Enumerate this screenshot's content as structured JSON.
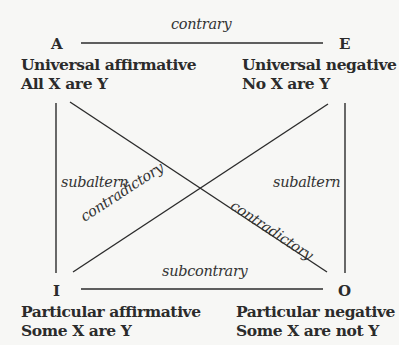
{
  "corners": {
    "A": {
      "letter": "A",
      "name": "Universal affirmative",
      "form": "All X are Y"
    },
    "E": {
      "letter": "E",
      "name": "Universal negative",
      "form": "No X are Y"
    },
    "I": {
      "letter": "I",
      "name": "Particular affirmative",
      "form": "Some X are Y"
    },
    "O": {
      "letter": "O",
      "name": "Particular negative",
      "form": "Some X are not Y"
    }
  },
  "relations": {
    "top": "contrary",
    "bottom": "subcontrary",
    "left": "subaltern",
    "right": "subaltern",
    "diagonal_ai": "contradictory",
    "diagonal_ao": "contradictory"
  },
  "colors": {
    "line": "#2b2b2b",
    "text": "#2b2b2b",
    "background": "#f7f7f5"
  }
}
